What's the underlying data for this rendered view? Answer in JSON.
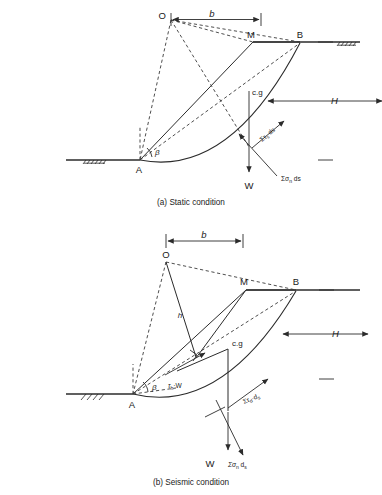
{
  "figures": [
    {
      "id": "static",
      "caption": "(a) Static condition",
      "points": {
        "O": "O",
        "M": "M",
        "B": "B",
        "A": "A"
      },
      "dimensions": {
        "b": "b",
        "H": "H"
      },
      "labels": {
        "beta": "β",
        "cg": "c.g",
        "weight": "W",
        "shear": "Στ",
        "shear_sub": "s",
        "shear_tail": " ds",
        "normal": "Σσ",
        "normal_sub": "n",
        "normal_tail": " ds"
      }
    },
    {
      "id": "seismic",
      "caption": "(b) Seismic condition",
      "points": {
        "O": "O",
        "M": "M",
        "B": "B",
        "A": "A"
      },
      "dimensions": {
        "b": "b",
        "H": "H",
        "h": "h"
      },
      "labels": {
        "beta": "β",
        "cg": "c.g",
        "weight": "W",
        "seismic_force": "τ",
        "seismic_force_sub": "h",
        "seismic_force_tail": "·W",
        "shear": "Στ",
        "shear_sub": "d",
        "shear_tail": "·d",
        "shear_sub2": "s",
        "normal": "Σσ",
        "normal_sub": "n",
        "normal_tail": " d",
        "normal_sub2": "s"
      }
    }
  ],
  "colors": {
    "ink": "#1a1a1a",
    "line": "#2b2b2b",
    "dash": "#3a3a3a",
    "background": "#ffffff"
  }
}
